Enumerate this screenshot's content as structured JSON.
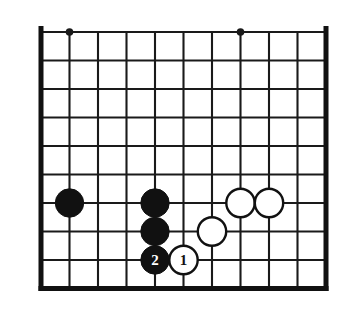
{
  "figure": {
    "board_kind": "go-board",
    "colors": {
      "background": "#ffffff",
      "line": "#1a1a1a",
      "border": "#111111",
      "black_stone": "#111111",
      "white_stone": "#ffffff",
      "white_stone_outline": "#111111",
      "black_label_text": "#ffffff",
      "white_label_text": "#111111"
    },
    "geometry": {
      "x0": 41,
      "y0": 32,
      "step_x": 28.5,
      "step_y": 28.5,
      "cols": 11,
      "rows": 10,
      "line_width": 2.1,
      "border_width": 5,
      "stone_radius": 14.2
    },
    "borders": {
      "left": true,
      "right": true,
      "bottom": true,
      "top": false
    },
    "star_points": [
      {
        "col": 1,
        "row": 0,
        "radius": 3.8
      },
      {
        "col": 7,
        "row": 0,
        "radius": 3.8
      }
    ],
    "stones": [
      {
        "name": "black-stone-left",
        "color": "black",
        "col": 1,
        "row": 6,
        "label": ""
      },
      {
        "name": "black-stone-upper",
        "color": "black",
        "col": 4,
        "row": 6,
        "label": ""
      },
      {
        "name": "black-stone-middle",
        "color": "black",
        "col": 4,
        "row": 7,
        "label": ""
      },
      {
        "name": "black-stone-move-2",
        "color": "black",
        "col": 4,
        "row": 8,
        "label": "2"
      },
      {
        "name": "white-stone-move-1",
        "color": "white",
        "col": 5,
        "row": 8,
        "label": "1"
      },
      {
        "name": "white-stone-center",
        "color": "white",
        "col": 6,
        "row": 7,
        "label": ""
      },
      {
        "name": "white-stone-right-inner",
        "color": "white",
        "col": 7,
        "row": 6,
        "label": ""
      },
      {
        "name": "white-stone-right-outer",
        "color": "white",
        "col": 8,
        "row": 6,
        "label": ""
      }
    ],
    "move_labels": [
      {
        "label": "1",
        "stone": "white-stone-move-1",
        "font_size": 15
      },
      {
        "label": "2",
        "stone": "black-stone-move-2",
        "font_size": 15
      }
    ]
  }
}
